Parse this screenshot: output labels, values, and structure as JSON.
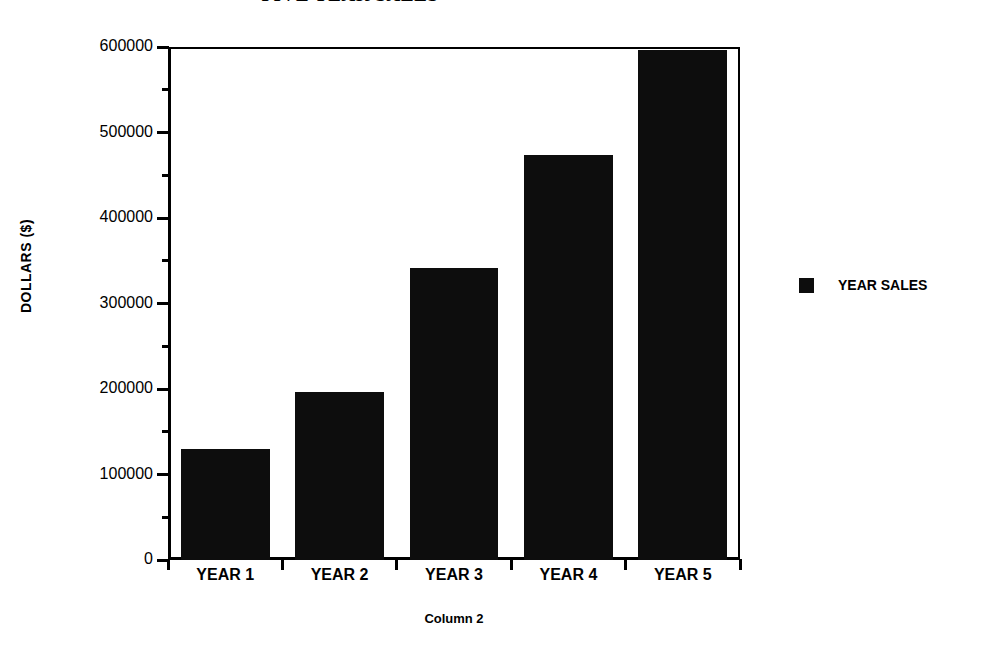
{
  "chart_data": {
    "type": "bar",
    "title": "FIVE YEAR SALES",
    "xlabel": "Column 2",
    "ylabel": "DOLLARS  ($)",
    "categories": [
      "YEAR 1",
      "YEAR 2",
      "YEAR 3",
      "YEAR 4",
      "YEAR 5"
    ],
    "series": [
      {
        "name": "YEAR SALES",
        "color": "#0d0d0d",
        "values": [
          130000,
          197000,
          342000,
          474000,
          596000
        ]
      }
    ],
    "ylim": [
      0,
      600000
    ],
    "y_major_ticks": [
      0,
      100000,
      200000,
      300000,
      400000,
      500000,
      600000
    ],
    "y_tick_labels": [
      "0",
      "100000",
      "200000",
      "300000",
      "400000",
      "500000",
      "600000"
    ],
    "y_minor_tick_interval": 50000,
    "grid": false,
    "legend_position": "right",
    "legend_entries": [
      {
        "label": "YEAR SALES",
        "color": "#0d0d0d",
        "swatch": "filled-square"
      }
    ],
    "background": "#ffffff",
    "frame_color": "#000000"
  }
}
